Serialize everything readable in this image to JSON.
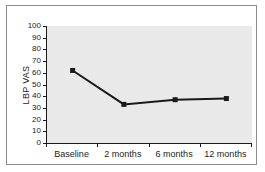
{
  "chart_data": {
    "type": "line",
    "categories": [
      "Baseline",
      "2 months",
      "6 months",
      "12 months"
    ],
    "values": [
      62,
      33,
      37,
      38
    ],
    "series": [
      {
        "name": "LBP VAS",
        "values": [
          62,
          33,
          37,
          38
        ]
      }
    ],
    "title": "",
    "xlabel": "",
    "ylabel": "LBP VAS",
    "ylim": [
      0,
      100
    ],
    "yticks": [
      0,
      10,
      20,
      30,
      40,
      50,
      60,
      70,
      80,
      90,
      100
    ],
    "grid": false,
    "legend_position": "none",
    "marker": "square",
    "colors": {
      "line": "#1a1a1a",
      "marker": "#1a1a1a",
      "plot_background": "#e9e9e9",
      "frame_border": "#8c8c8c",
      "axis": "#1a1a1a",
      "text": "#1a1a1a",
      "background": "#ffffff"
    }
  }
}
